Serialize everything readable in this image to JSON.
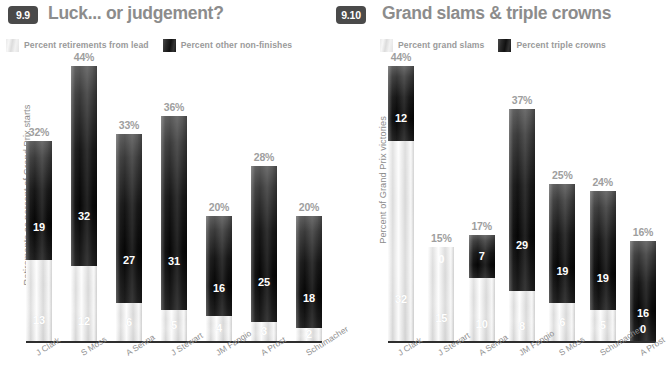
{
  "charts": [
    {
      "badge": "9.9",
      "title": "Luck... or judgement?",
      "ylabel": "Retirements as percent of Grand Prix starts",
      "legend": [
        {
          "label": "Percent retirements from lead",
          "style": "light"
        },
        {
          "label": "Percent other non-finishes",
          "style": "dark"
        }
      ],
      "chart_data": {
        "type": "bar",
        "stacked": true,
        "title": "Luck... or judgement?",
        "xlabel": "",
        "ylabel": "Retirements as percent of Grand Prix starts",
        "ylim": [
          0,
          46
        ],
        "grid": false,
        "legend_position": "top",
        "categories": [
          "J Clark",
          "S Moss",
          "A Senna",
          "J Stewart",
          "JM Fangio",
          "A Prost",
          "Schumacher"
        ],
        "totals_percent": [
          32,
          44,
          33,
          36,
          20,
          28,
          20
        ],
        "total_labels": [
          "32%",
          "44%",
          "33%",
          "36%",
          "20%",
          "28%",
          "20%"
        ],
        "series": [
          {
            "name": "Percent other non-finishes",
            "style": "dark",
            "values": [
              19,
              32,
              27,
              31,
              16,
              25,
              18
            ]
          },
          {
            "name": "Percent retirements from lead",
            "style": "light",
            "values": [
              13,
              12,
              6,
              5,
              4,
              3,
              2
            ]
          }
        ]
      }
    },
    {
      "badge": "9.10",
      "title": "Grand slams & triple crowns",
      "ylabel": "Percent of Grand Prix victories",
      "legend": [
        {
          "label": "Percent grand slams",
          "style": "light"
        },
        {
          "label": "Percent triple crowns",
          "style": "dark"
        }
      ],
      "chart_data": {
        "type": "bar",
        "stacked": true,
        "title": "Grand slams & triple crowns",
        "xlabel": "",
        "ylabel": "Percent of Grand Prix victories",
        "ylim": [
          0,
          46
        ],
        "grid": false,
        "legend_position": "top",
        "categories": [
          "J Clark",
          "J Stewart",
          "A Senna",
          "JM Fangio",
          "S Moss",
          "Schumacher",
          "A Prost"
        ],
        "totals_percent": [
          44,
          15,
          17,
          37,
          25,
          24,
          16
        ],
        "total_labels": [
          "44%",
          "15%",
          "17%",
          "37%",
          "25%",
          "24%",
          "16%"
        ],
        "series": [
          {
            "name": "Percent triple crowns",
            "style": "dark",
            "values": [
              12,
              0,
              7,
              29,
              19,
              19,
              16
            ]
          },
          {
            "name": "Percent grand slams",
            "style": "light",
            "values": [
              32,
              15,
              10,
              8,
              6,
              5,
              0
            ]
          }
        ]
      }
    }
  ]
}
